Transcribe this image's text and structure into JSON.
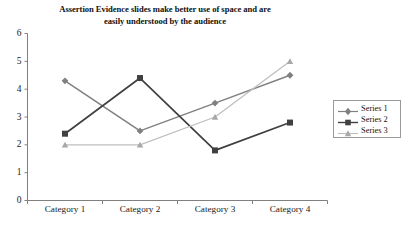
{
  "chart_data": {
    "type": "line",
    "title": "Assertion Evidence slides make better use of space and are easily understood by the audience",
    "title_line1": "Assertion Evidence slides make better use of space and are",
    "title_line2": "easily understood by the audience",
    "xlabel": "",
    "ylabel": "",
    "categories": [
      "Category 1",
      "Category 2",
      "Category 3",
      "Category 4"
    ],
    "ylim": [
      0,
      6
    ],
    "yticks": [
      0,
      1,
      2,
      3,
      4,
      5,
      6
    ],
    "ytick_labels": [
      "0",
      "1",
      "2",
      "3",
      "4",
      "5",
      "6"
    ],
    "grid": false,
    "legend_position": "right",
    "series": [
      {
        "name": "Series 1",
        "marker": "diamond",
        "color": "#808080",
        "values": [
          4.3,
          2.5,
          3.5,
          4.5
        ]
      },
      {
        "name": "Series 2",
        "marker": "square",
        "color": "#404040",
        "values": [
          2.4,
          4.4,
          1.8,
          2.8
        ]
      },
      {
        "name": "Series 3",
        "marker": "triangle",
        "color": "#bfbfbf",
        "values": [
          2.0,
          2.0,
          3.0,
          5.0
        ]
      }
    ]
  },
  "axis": {
    "line_color": "#808080"
  },
  "legend": {
    "entries": [
      {
        "label": "Series 1"
      },
      {
        "label": "Series 2"
      },
      {
        "label": "Series 3"
      }
    ]
  }
}
